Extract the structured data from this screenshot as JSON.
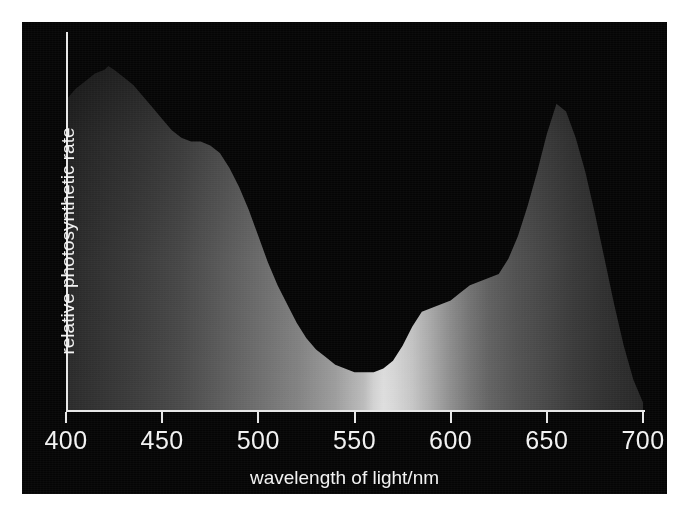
{
  "figure": {
    "background": "#ffffff",
    "panel_color": "#050505",
    "axis_color": "#e8e8e8",
    "text_color": "#f2f2f2"
  },
  "axes": {
    "x_label": "wavelength of light/nm",
    "y_label": "relative photosynthetic rate",
    "x_ticks": [
      "400",
      "450",
      "500",
      "550",
      "600",
      "650",
      "700"
    ]
  },
  "chart_data": {
    "type": "area",
    "title": "",
    "subtitle": "",
    "xlabel": "wavelength of light/nm",
    "ylabel": "relative photosynthetic rate",
    "xlim": [
      400,
      700
    ],
    "ylim": [
      0,
      100
    ],
    "xticks": [
      400,
      450,
      500,
      550,
      600,
      650,
      700
    ],
    "xticklabels": [
      "400",
      "450",
      "500",
      "550",
      "600",
      "650",
      "700"
    ],
    "yticks": [],
    "yticklabels": [],
    "grid": false,
    "legend": null,
    "fill": "visible-spectrum-gradient",
    "annotations": [
      {
        "label": "blue peak",
        "x": 422,
        "y": 91
      },
      {
        "label": "blue-green shoulder",
        "x": 455,
        "y": 72
      },
      {
        "label": "green minimum",
        "x": 555,
        "y": 10
      },
      {
        "label": "orange shoulder",
        "x": 585,
        "y": 26
      },
      {
        "label": "red peak",
        "x": 655,
        "y": 81
      }
    ],
    "series": [
      {
        "name": "relative photosynthetic rate",
        "x": [
          400,
          405,
          410,
          415,
          420,
          422,
          425,
          430,
          435,
          440,
          445,
          450,
          455,
          460,
          465,
          470,
          475,
          480,
          485,
          490,
          495,
          500,
          505,
          510,
          515,
          520,
          525,
          530,
          535,
          540,
          545,
          550,
          555,
          560,
          565,
          570,
          575,
          580,
          585,
          590,
          595,
          600,
          605,
          610,
          615,
          620,
          625,
          630,
          635,
          640,
          645,
          650,
          655,
          660,
          665,
          670,
          675,
          680,
          685,
          690,
          695,
          700
        ],
        "y": [
          82,
          85,
          87,
          89,
          90,
          91,
          90,
          88,
          86,
          83,
          80,
          77,
          74,
          72,
          71,
          71,
          70,
          68,
          64,
          59,
          53,
          46,
          39,
          33,
          28,
          23,
          19,
          16,
          14,
          12,
          11,
          10,
          10,
          10,
          11,
          13,
          17,
          22,
          26,
          27,
          28,
          29,
          31,
          33,
          34,
          35,
          36,
          40,
          46,
          54,
          63,
          73,
          81,
          79,
          72,
          63,
          52,
          40,
          28,
          17,
          8,
          2
        ]
      }
    ]
  }
}
